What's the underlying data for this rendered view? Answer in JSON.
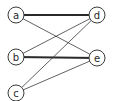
{
  "diagram": {
    "type": "bipartite-graph",
    "nodes": [
      {
        "id": "a",
        "label": "a",
        "x": 16,
        "y": 15
      },
      {
        "id": "b",
        "label": "b",
        "x": 16,
        "y": 57
      },
      {
        "id": "c",
        "label": "c",
        "x": 16,
        "y": 93
      },
      {
        "id": "d",
        "label": "d",
        "x": 97,
        "y": 15
      },
      {
        "id": "e",
        "label": "e",
        "x": 97,
        "y": 58
      }
    ],
    "edges": [
      {
        "from": "a",
        "to": "d",
        "style": "thick"
      },
      {
        "from": "a",
        "to": "e",
        "style": "thin"
      },
      {
        "from": "b",
        "to": "d",
        "style": "thin"
      },
      {
        "from": "b",
        "to": "e",
        "style": "thick"
      },
      {
        "from": "c",
        "to": "d",
        "style": "thin"
      },
      {
        "from": "c",
        "to": "e",
        "style": "thin"
      }
    ],
    "node_radius": 8,
    "colors": {
      "stroke": "#3a3a3a",
      "background": "#ffffff"
    }
  }
}
